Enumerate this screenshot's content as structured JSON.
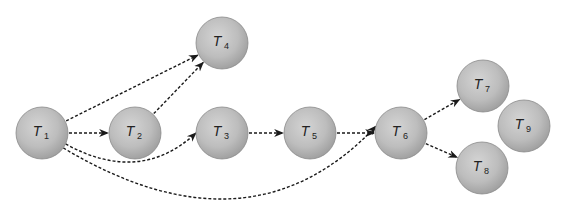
{
  "diagram": {
    "type": "task-dependency-graph",
    "node_fill": "#b9b9b9",
    "node_stroke": "#8a8a8a",
    "edge_color": "#1a1a1a",
    "nodes": [
      {
        "id": "T1",
        "label": "T",
        "sub": "1"
      },
      {
        "id": "T2",
        "label": "T",
        "sub": "2"
      },
      {
        "id": "T3",
        "label": "T",
        "sub": "3"
      },
      {
        "id": "T4",
        "label": "T",
        "sub": "4"
      },
      {
        "id": "T5",
        "label": "T",
        "sub": "5"
      },
      {
        "id": "T6",
        "label": "T",
        "sub": "6"
      },
      {
        "id": "T7",
        "label": "T",
        "sub": "7"
      },
      {
        "id": "T8",
        "label": "T",
        "sub": "8"
      },
      {
        "id": "T9",
        "label": "T",
        "sub": "9"
      }
    ],
    "edges": [
      {
        "from": "T1",
        "to": "T4",
        "style": "dashed"
      },
      {
        "from": "T1",
        "to": "T2",
        "style": "dashed"
      },
      {
        "from": "T1",
        "to": "T3",
        "style": "dashed"
      },
      {
        "from": "T1",
        "to": "T6",
        "style": "dashed"
      },
      {
        "from": "T2",
        "to": "T4",
        "style": "dashed"
      },
      {
        "from": "T3",
        "to": "T5",
        "style": "dashed"
      },
      {
        "from": "T5",
        "to": "T6",
        "style": "dashed"
      },
      {
        "from": "T6",
        "to": "T7",
        "style": "dashed"
      },
      {
        "from": "T6",
        "to": "T8",
        "style": "dashed"
      }
    ]
  }
}
